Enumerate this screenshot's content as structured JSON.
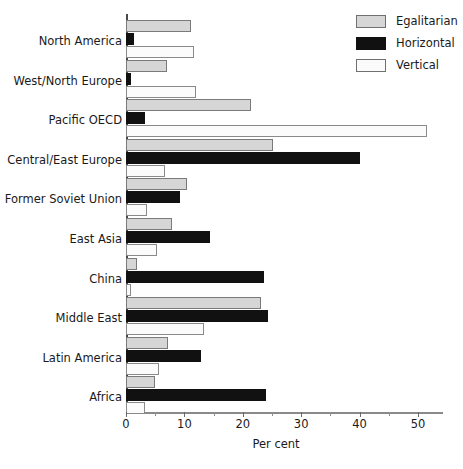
{
  "chart_data": {
    "type": "bar",
    "orientation": "horizontal",
    "title": "",
    "xlabel": "Per cent",
    "ylabel": "",
    "xlim": [
      0,
      54
    ],
    "xticks": [
      0,
      10,
      20,
      30,
      40,
      50
    ],
    "xtick_labels": [
      "0",
      "10",
      "20",
      "30",
      "40",
      "50"
    ],
    "xminor_ticks": [
      5,
      15,
      25,
      35,
      45
    ],
    "grid": false,
    "legend_position": "top-right",
    "categories": [
      "North America",
      "West/North Europe",
      "Pacific OECD",
      "Central/East Europe",
      "Former Soviet Union",
      "East Asia",
      "China",
      "Middle East",
      "Latin America",
      "Africa"
    ],
    "series": [
      {
        "name": "Egalitarian",
        "color": "#d6d6d6",
        "values": [
          11.1,
          7.0,
          21.4,
          25.2,
          10.4,
          7.9,
          1.9,
          23.1,
          7.2,
          5.0
        ]
      },
      {
        "name": "Horizontal",
        "color": "#111111",
        "values": [
          1.4,
          0.9,
          3.2,
          40.0,
          9.2,
          14.4,
          23.6,
          24.3,
          12.8,
          23.9
        ]
      },
      {
        "name": "Vertical",
        "color": "#fbfbfb",
        "values": [
          11.6,
          12.0,
          51.5,
          6.7,
          3.6,
          5.3,
          0.9,
          13.4,
          5.7,
          3.3
        ]
      }
    ]
  }
}
